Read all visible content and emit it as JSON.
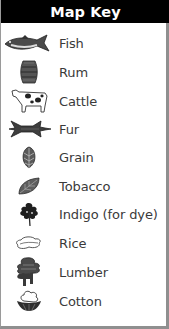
{
  "map_key": {
    "title": "Map Key",
    "items": [
      {
        "label": "Fish",
        "icon": "fish-icon"
      },
      {
        "label": "Rum",
        "icon": "barrel-icon"
      },
      {
        "label": "Cattle",
        "icon": "cow-icon"
      },
      {
        "label": "Fur",
        "icon": "pelt-icon"
      },
      {
        "label": "Grain",
        "icon": "wheat-icon"
      },
      {
        "label": "Tobacco",
        "icon": "tobacco-leaf-icon"
      },
      {
        "label": "Indigo (for dye)",
        "icon": "indigo-plant-icon"
      },
      {
        "label": "Rice",
        "icon": "rice-icon"
      },
      {
        "label": "Lumber",
        "icon": "tree-icon"
      },
      {
        "label": "Cotton",
        "icon": "cotton-boll-icon"
      }
    ]
  },
  "colors": {
    "header_bg": "#000000",
    "header_text": "#ffffff",
    "label_text": "#3a3a3a",
    "border": "#8f8f8f",
    "icon_dark": "#2e2e2e",
    "icon_mid": "#6a6a6a"
  }
}
